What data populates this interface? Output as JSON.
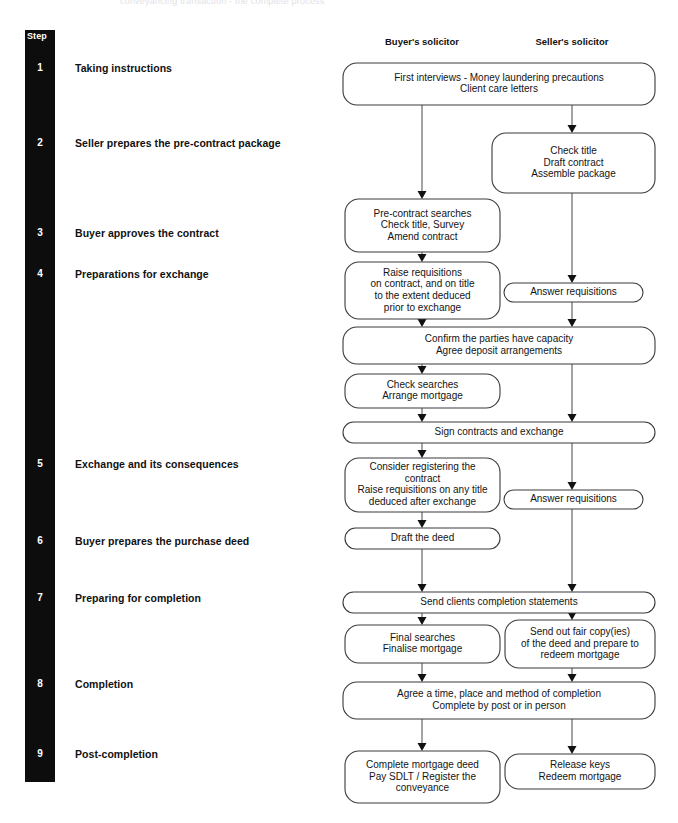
{
  "page": {
    "top_caption": "conveyancing transaction - the complete process",
    "bg_color": "#ffffff",
    "spine_color": "#0d0d0d",
    "box_stroke": "#3a3a3e",
    "connector_color": "#58585c"
  },
  "step_column": {
    "header": "Step",
    "steps": [
      {
        "number": "1",
        "label": "Taking instructions",
        "y": 62
      },
      {
        "number": "2",
        "label": "Seller prepares the pre-contract package",
        "y": 137
      },
      {
        "number": "3",
        "label": "Buyer approves the contract",
        "y": 227
      },
      {
        "number": "4",
        "label": "Preparations for exchange",
        "y": 268
      },
      {
        "number": "5",
        "label": "Exchange and its consequences",
        "y": 458
      },
      {
        "number": "6",
        "label": "Buyer prepares the purchase deed",
        "y": 535
      },
      {
        "number": "7",
        "label": "Preparing for completion",
        "y": 592
      },
      {
        "number": "8",
        "label": "Completion",
        "y": 678
      },
      {
        "number": "9",
        "label": "Post-completion",
        "y": 748
      }
    ]
  },
  "columns": [
    {
      "key": "buyer",
      "heading": "Buyer's solicitor",
      "center_x": 422
    },
    {
      "key": "seller",
      "heading": "Seller's solicitor",
      "center_x": 572
    }
  ],
  "nodes": [
    {
      "id": "first-interviews",
      "column": "both",
      "x": 343,
      "y": 63,
      "w": 312,
      "h": 42,
      "lines": [
        "First interviews - Money laundering precautions",
        "Client care letters"
      ]
    },
    {
      "id": "check-title-draft-contract",
      "column": "seller",
      "x": 492,
      "y": 133,
      "w": 163,
      "h": 60,
      "lines": [
        "Check title",
        "Draft contract",
        "Assemble package"
      ]
    },
    {
      "id": "pre-contract-searches",
      "column": "buyer",
      "x": 345,
      "y": 199,
      "w": 155,
      "h": 53,
      "lines": [
        "Pre-contract searches",
        "Check title, Survey",
        "Amend contract"
      ]
    },
    {
      "id": "raise-requisitions-pre-exchange",
      "column": "buyer",
      "x": 345,
      "y": 262,
      "w": 155,
      "h": 57,
      "lines": [
        "Raise requisitions",
        "on contract, and on title",
        "to the extent deduced",
        "prior to exchange"
      ]
    },
    {
      "id": "answer-requisitions-pre-exchange",
      "column": "seller",
      "x": 504,
      "y": 283,
      "w": 139,
      "h": 19,
      "lines": [
        "Answer requisitions"
      ]
    },
    {
      "id": "confirm-capacity",
      "column": "both",
      "x": 343,
      "y": 327,
      "w": 312,
      "h": 37,
      "lines": [
        "Confirm the parties have capacity",
        "Agree deposit arrangements"
      ]
    },
    {
      "id": "check-searches",
      "column": "buyer",
      "x": 345,
      "y": 374,
      "w": 155,
      "h": 34,
      "lines": [
        "Check searches",
        "Arrange mortgage"
      ]
    },
    {
      "id": "sign-contracts-exchange",
      "column": "both",
      "x": 343,
      "y": 422,
      "w": 312,
      "h": 21,
      "lines": [
        "Sign contracts and exchange"
      ]
    },
    {
      "id": "consider-registering",
      "column": "buyer",
      "x": 345,
      "y": 458,
      "w": 155,
      "h": 54,
      "lines": [
        "Consider registering the",
        "contract",
        "Raise requisitions on any title",
        "deduced after exchange"
      ]
    },
    {
      "id": "answer-requisitions-post-exchange",
      "column": "seller",
      "x": 504,
      "y": 490,
      "w": 139,
      "h": 19,
      "lines": [
        "Answer requisitions"
      ]
    },
    {
      "id": "draft-the-deed",
      "column": "buyer",
      "x": 345,
      "y": 528,
      "w": 155,
      "h": 21,
      "lines": [
        "Draft the deed"
      ]
    },
    {
      "id": "send-completion-statements",
      "column": "both",
      "x": 343,
      "y": 592,
      "w": 312,
      "h": 21,
      "lines": [
        "Send clients completion statements"
      ]
    },
    {
      "id": "final-searches",
      "column": "buyer",
      "x": 345,
      "y": 625,
      "w": 155,
      "h": 38,
      "lines": [
        "Final searches",
        "Finalise mortgage"
      ]
    },
    {
      "id": "send-fair-copies",
      "column": "seller",
      "x": 505,
      "y": 620,
      "w": 150,
      "h": 48,
      "lines": [
        "Send out fair copy(ies)",
        "of the deed and prepare to",
        "redeem mortgage"
      ]
    },
    {
      "id": "agree-time-place",
      "column": "both",
      "x": 343,
      "y": 682,
      "w": 312,
      "h": 37,
      "lines": [
        "Agree a time, place and method of completion",
        "Complete by post or in person"
      ]
    },
    {
      "id": "complete-mortgage-deed",
      "column": "buyer",
      "x": 345,
      "y": 751,
      "w": 155,
      "h": 52,
      "lines": [
        "Complete mortgage deed",
        "Pay SDLT / Register the",
        "conveyance"
      ]
    },
    {
      "id": "release-keys",
      "column": "seller",
      "x": 505,
      "y": 754,
      "w": 150,
      "h": 35,
      "lines": [
        "Release keys",
        "Redeem mortgage"
      ]
    }
  ],
  "connectors": [
    {
      "id": "buyer-first-to-precontract",
      "x1": 422,
      "y1": 105,
      "x2": 422,
      "y2": 199,
      "arrow": true
    },
    {
      "id": "seller-first-to-checktitle",
      "x1": 572,
      "y1": 105,
      "x2": 572,
      "y2": 133,
      "arrow": true
    },
    {
      "id": "precontract-to-raise-req",
      "x1": 422,
      "y1": 252,
      "x2": 422,
      "y2": 262,
      "arrow": true
    },
    {
      "id": "checktitle-to-answer-req",
      "x1": 572,
      "y1": 193,
      "x2": 572,
      "y2": 283,
      "arrow": true
    },
    {
      "id": "raise-req-to-confirm",
      "x1": 422,
      "y1": 319,
      "x2": 422,
      "y2": 327,
      "arrow": true
    },
    {
      "id": "answer-req-to-confirm",
      "x1": 572,
      "y1": 302,
      "x2": 572,
      "y2": 327,
      "arrow": true
    },
    {
      "id": "confirm-to-check-searches",
      "x1": 422,
      "y1": 364,
      "x2": 422,
      "y2": 374,
      "arrow": true
    },
    {
      "id": "check-searches-to-sign",
      "x1": 422,
      "y1": 408,
      "x2": 422,
      "y2": 422,
      "arrow": true
    },
    {
      "id": "confirm-seller-to-sign",
      "x1": 572,
      "y1": 364,
      "x2": 572,
      "y2": 422,
      "arrow": true
    },
    {
      "id": "sign-to-consider",
      "x1": 422,
      "y1": 443,
      "x2": 422,
      "y2": 458,
      "arrow": true
    },
    {
      "id": "sign-to-answer-req2",
      "x1": 572,
      "y1": 443,
      "x2": 572,
      "y2": 490,
      "arrow": true
    },
    {
      "id": "consider-to-draft-deed",
      "x1": 422,
      "y1": 512,
      "x2": 422,
      "y2": 528,
      "arrow": true
    },
    {
      "id": "draft-deed-to-send-statements",
      "x1": 422,
      "y1": 549,
      "x2": 422,
      "y2": 592,
      "arrow": true
    },
    {
      "id": "answer-req2-to-send-statements",
      "x1": 572,
      "y1": 509,
      "x2": 572,
      "y2": 592,
      "arrow": true
    },
    {
      "id": "send-statements-to-final-searches",
      "x1": 422,
      "y1": 613,
      "x2": 422,
      "y2": 625,
      "arrow": true
    },
    {
      "id": "send-statements-to-fair-copies",
      "x1": 572,
      "y1": 613,
      "x2": 572,
      "y2": 620,
      "arrow": true
    },
    {
      "id": "final-searches-to-agree",
      "x1": 422,
      "y1": 663,
      "x2": 422,
      "y2": 682,
      "arrow": true
    },
    {
      "id": "fair-copies-to-agree",
      "x1": 572,
      "y1": 668,
      "x2": 572,
      "y2": 682,
      "arrow": true
    },
    {
      "id": "agree-to-complete-deed",
      "x1": 422,
      "y1": 719,
      "x2": 422,
      "y2": 751,
      "arrow": true
    },
    {
      "id": "agree-to-release-keys",
      "x1": 572,
      "y1": 719,
      "x2": 572,
      "y2": 754,
      "arrow": true
    }
  ]
}
